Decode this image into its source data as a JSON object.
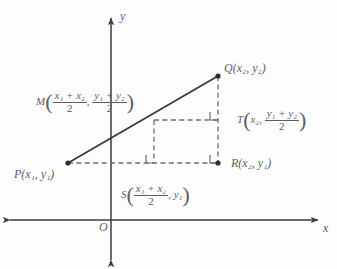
{
  "figure": {
    "type": "geometry-diagram",
    "topic": "midpoint-formula",
    "background_color": "#fdfdfd",
    "ink_color": "#3a3a3f",
    "label_color": "#5e5e64"
  },
  "axes": {
    "x_label": "x",
    "y_label": "y",
    "origin_label": "O",
    "x_axis": {
      "y_px": 220,
      "x_start_px": 8,
      "x_end_px": 320,
      "arrows": "both"
    },
    "y_axis": {
      "x_px": 111,
      "y_start_px": 16,
      "y_end_px": 262,
      "arrows": "both"
    }
  },
  "points": {
    "P": {
      "name": "P",
      "x_px": 68,
      "y_px": 163,
      "dot": true,
      "label_x": "x",
      "label_x_sub": "1",
      "label_y": "y",
      "label_y_sub": "1"
    },
    "Q": {
      "name": "Q",
      "x_px": 218,
      "y_px": 76,
      "dot": true,
      "label_x": "x",
      "label_x_sub": "2",
      "label_y": "y",
      "label_y_sub": "2"
    },
    "R": {
      "name": "R",
      "x_px": 218,
      "y_px": 163,
      "dot": true,
      "label_x": "x",
      "label_x_sub": "2",
      "label_y": "y",
      "label_y_sub": "1"
    },
    "M": {
      "name": "M",
      "x_px": 154,
      "y_px": 120,
      "dot": false
    },
    "S": {
      "name": "S",
      "x_px": 154,
      "y_px": 163,
      "dot": false
    },
    "T": {
      "name": "T",
      "x_px": 218,
      "y_px": 120,
      "dot": false
    }
  },
  "labels": {
    "P": {
      "point": "P",
      "coords": "(x₁, y₁)"
    },
    "Q": {
      "point": "Q",
      "coords": "(x₂, y₂)"
    },
    "R": {
      "point": "R",
      "coords": "(x₂, y₁)"
    },
    "M": {
      "point": "M",
      "first_num": "x₁ + x₂",
      "first_den": "2",
      "second_num": "y₁ + y₂",
      "second_den": "2"
    },
    "S": {
      "point": "S",
      "first_num": "x₁ + x₂",
      "first_den": "2",
      "second": "y₁"
    },
    "T": {
      "point": "T",
      "first": "x₂",
      "second_num": "y₁ + y₂",
      "second_den": "2"
    }
  },
  "segments": {
    "PQ": {
      "style": "solid",
      "from": "P",
      "to": "Q",
      "color": "#3a3a3f",
      "width": 1.7
    },
    "PR": {
      "style": "dashed",
      "from": "P",
      "to": "R",
      "color": "#6d6d73"
    },
    "QR": {
      "style": "dashed",
      "from": "Q",
      "to": "R",
      "color": "#6d6d73"
    },
    "MS": {
      "style": "dashed",
      "from": "M",
      "to": "S",
      "color": "#6d6d73"
    },
    "MT": {
      "style": "dashed",
      "from": "M",
      "to": "T",
      "color": "#6d6d73"
    }
  },
  "right_angle_marks": [
    {
      "at": "S",
      "size_px": 8
    },
    {
      "at": "T",
      "size_px": 8
    },
    {
      "at": "R",
      "size_px": 8
    }
  ]
}
